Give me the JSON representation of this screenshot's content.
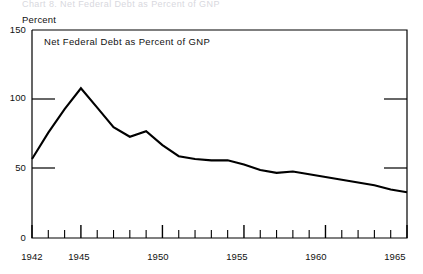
{
  "figure": {
    "top_caption_fragment": "Chart 8.  Net Federal Debt as Percent of GNP",
    "y_axis_title": "Percent",
    "plot_note": "Net Federal Debt as Percent of GNP"
  },
  "chart_data": {
    "type": "line",
    "title": "Net Federal Debt as Percent of GNP",
    "xlabel": "",
    "ylabel": "Percent",
    "xlim": [
      1942,
      1965
    ],
    "ylim": [
      0,
      150
    ],
    "yticks": [
      0,
      50,
      100,
      150
    ],
    "ytick_labels": [
      "0",
      "50",
      "100",
      "150"
    ],
    "xticks": [
      1942,
      1943,
      1944,
      1945,
      1946,
      1947,
      1948,
      1949,
      1950,
      1951,
      1952,
      1953,
      1954,
      1955,
      1956,
      1957,
      1958,
      1959,
      1960,
      1961,
      1962,
      1963,
      1964,
      1965
    ],
    "xtick_labels_shown": [
      "1942",
      "1945",
      "1950",
      "1955",
      "1960",
      "1965"
    ],
    "major_xticks": [
      1942,
      1945,
      1950,
      1955,
      1960,
      1965
    ],
    "grid": false,
    "legend": null,
    "line_color": "#000000",
    "x": [
      1942,
      1943,
      1944,
      1945,
      1946,
      1947,
      1948,
      1949,
      1950,
      1951,
      1952,
      1953,
      1954,
      1955,
      1956,
      1957,
      1958,
      1959,
      1960,
      1961,
      1962,
      1963,
      1964,
      1965
    ],
    "values": [
      57,
      76,
      93,
      108,
      94,
      80,
      73,
      77,
      67,
      59,
      57,
      56,
      56,
      53,
      49,
      47,
      48,
      46,
      44,
      42,
      40,
      38,
      35,
      33
    ],
    "series": [
      {
        "name": "Net Federal Debt as Percent of GNP",
        "values": [
          57,
          76,
          93,
          108,
          94,
          80,
          73,
          77,
          67,
          59,
          57,
          56,
          56,
          53,
          49,
          47,
          48,
          46,
          44,
          42,
          40,
          38,
          35,
          33
        ]
      }
    ]
  },
  "axes": {
    "y_labels": [
      "150",
      "100",
      "50",
      "0"
    ],
    "x_labels": [
      "1942",
      "1945",
      "1950",
      "1955",
      "1960",
      "1965"
    ]
  }
}
